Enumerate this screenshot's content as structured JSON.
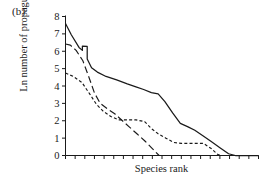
{
  "figure": {
    "panel_label": "(b)",
    "background": "#ffffff",
    "axis_color": "#1a1a1a",
    "line_color": "#1a1a1a"
  },
  "chart_data": {
    "type": "line",
    "title": "",
    "panel": "(b)",
    "xlabel": "Species rank",
    "ylabel": "Ln number of propagules",
    "xlim": [
      0,
      20
    ],
    "ylim": [
      0,
      8
    ],
    "yticks": [
      0,
      1,
      2,
      3,
      4,
      5,
      6,
      7,
      8
    ],
    "ytick_labels": [
      "0",
      "1",
      "2",
      "3",
      "4",
      "5",
      "6",
      "7",
      "8"
    ],
    "xticks": [
      0,
      1,
      2,
      3,
      4,
      5,
      6,
      7,
      8,
      9,
      10,
      11,
      12,
      13,
      14,
      15,
      16,
      17,
      18,
      19,
      20
    ],
    "xtick_labels": [],
    "grid": false,
    "legend": false,
    "legend_position": "none",
    "series": [
      {
        "name": "solid",
        "style": "solid",
        "x": [
          0.0,
          0.6,
          1.4,
          1.75,
          1.75,
          2.25,
          2.25,
          2.7,
          3.3,
          4.2,
          5.3,
          6.4,
          7.3,
          8.1,
          8.9,
          9.6,
          10.3,
          11.1,
          11.9,
          12.7,
          13.4,
          14.2,
          15.1,
          16.0,
          16.9,
          17.6,
          20.0
        ],
        "y": [
          7.6,
          6.95,
          6.22,
          6.05,
          6.3,
          6.28,
          5.55,
          5.05,
          4.8,
          4.55,
          4.35,
          4.12,
          3.95,
          3.8,
          3.62,
          3.55,
          3.1,
          2.45,
          1.85,
          1.65,
          1.45,
          1.15,
          0.8,
          0.45,
          0.1,
          0.0,
          0.0
        ]
      },
      {
        "name": "short-dashed",
        "style": "dotted",
        "x": [
          0.0,
          0.8,
          1.7,
          2.5,
          3.2,
          3.9,
          4.7,
          5.5,
          6.4,
          7.3,
          8.2,
          8.9,
          9.6,
          10.4,
          11.2,
          12.0,
          12.8,
          13.6,
          14.3,
          15.1,
          15.8,
          16.2,
          20.0
        ],
        "y": [
          4.75,
          4.55,
          4.2,
          3.55,
          2.95,
          2.55,
          2.25,
          2.05,
          2.05,
          2.05,
          1.95,
          1.55,
          1.25,
          1.0,
          0.75,
          0.7,
          0.7,
          0.7,
          0.7,
          0.4,
          0.05,
          0.0,
          0.0
        ]
      },
      {
        "name": "long-dashed",
        "style": "dashed",
        "x": [
          0.0,
          0.5,
          1.1,
          1.8,
          2.4,
          3.0,
          3.6,
          4.3,
          5.1,
          5.9,
          6.6,
          7.4,
          8.2,
          9.0,
          9.7,
          20.0
        ],
        "y": [
          6.42,
          6.35,
          6.05,
          5.45,
          4.55,
          3.6,
          3.0,
          2.7,
          2.4,
          2.0,
          1.65,
          1.25,
          0.85,
          0.4,
          0.0,
          0.0
        ]
      }
    ]
  }
}
